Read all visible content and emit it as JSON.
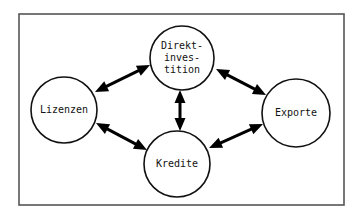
{
  "diagram": {
    "frame": {
      "x": 19,
      "y": 14,
      "width": 325,
      "height": 191
    },
    "colors": {
      "stroke": "#111111",
      "frame": "#555555",
      "background": "#ffffff"
    },
    "nodes": [
      {
        "id": "direktinvestition",
        "label_lines": [
          "Direkt-",
          "inves-",
          "tition"
        ],
        "cx": 182,
        "cy": 58,
        "r": 32
      },
      {
        "id": "lizenzen",
        "label_lines": [
          "Lizenzen"
        ],
        "cx": 64,
        "cy": 110,
        "r": 33
      },
      {
        "id": "exporte",
        "label_lines": [
          "Exporte"
        ],
        "cx": 296,
        "cy": 113,
        "r": 34
      },
      {
        "id": "kredite",
        "label_lines": [
          "Kredite"
        ],
        "cx": 177,
        "cy": 164,
        "r": 33
      }
    ],
    "edges": [
      {
        "from": "lizenzen",
        "to": "direktinvestition",
        "type": "bidirectional",
        "x1": 95,
        "y1": 92,
        "x2": 150,
        "y2": 65
      },
      {
        "from": "direktinvestition",
        "to": "exporte",
        "type": "bidirectional",
        "x1": 216,
        "y1": 69,
        "x2": 266,
        "y2": 95
      },
      {
        "from": "direktinvestition",
        "to": "kredite",
        "type": "bidirectional",
        "x1": 180,
        "y1": 90,
        "x2": 180,
        "y2": 131
      },
      {
        "from": "lizenzen",
        "to": "kredite",
        "type": "bidirectional",
        "x1": 96,
        "y1": 123,
        "x2": 147,
        "y2": 150
      },
      {
        "from": "kredite",
        "to": "exporte",
        "type": "bidirectional",
        "x1": 209,
        "y1": 148,
        "x2": 263,
        "y2": 124
      }
    ]
  }
}
